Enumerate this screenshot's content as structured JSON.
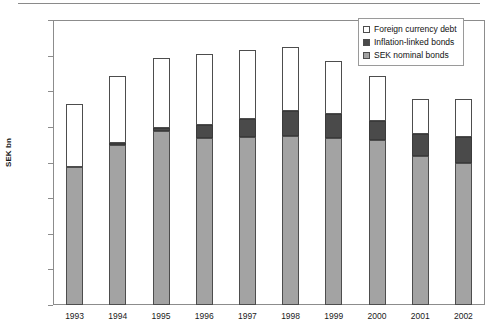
{
  "chart_data": {
    "type": "bar",
    "stacked": true,
    "title": "",
    "subtitle": "",
    "xlabel": "",
    "ylabel": "SEK bn",
    "ylim": [
      0,
      1600
    ],
    "ytick_step": 200,
    "ytick_labels": [
      "1,600",
      "1,400",
      "1,200",
      "1,000",
      "800",
      "600",
      "400",
      "200",
      "0"
    ],
    "ytick_values": [
      1600,
      1400,
      1200,
      1000,
      800,
      600,
      400,
      200,
      0
    ],
    "grid": false,
    "legend_position": "top-right",
    "categories": [
      "1993",
      "1994",
      "1995",
      "1996",
      "1997",
      "1998",
      "1999",
      "2000",
      "2001",
      "2002"
    ],
    "series": [
      {
        "name": "SEK nominal bonds",
        "color": "#a3a3a3",
        "values": [
          775,
          900,
          975,
          935,
          945,
          950,
          935,
          925,
          835,
          800
        ]
      },
      {
        "name": "Inflation-linked bonds",
        "color": "#4a4a4a",
        "values": [
          0,
          10,
          20,
          75,
          100,
          140,
          140,
          110,
          125,
          145
        ]
      },
      {
        "name": "Foreign currency debt",
        "color": "#ffffff",
        "values": [
          355,
          375,
          390,
          400,
          385,
          360,
          295,
          250,
          195,
          210
        ]
      }
    ],
    "totals": [
      1130,
      1285,
      1385,
      1410,
      1430,
      1450,
      1370,
      1285,
      1155,
      1155
    ]
  },
  "legend": {
    "items": [
      {
        "label": "Foreign currency debt",
        "swatch": "foreign"
      },
      {
        "label": "Inflation-linked bonds",
        "swatch": "inflation"
      },
      {
        "label": "SEK nominal bonds",
        "swatch": "nominal"
      }
    ]
  },
  "axes": {
    "y_title": "SEK bn"
  }
}
